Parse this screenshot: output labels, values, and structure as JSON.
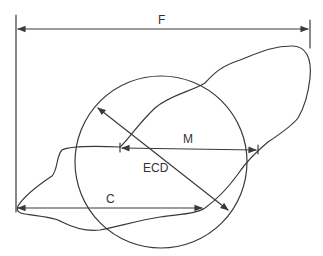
{
  "diagram": {
    "colors": {
      "line": "#3a3a3a",
      "text": "#333333",
      "background": "#ffffff"
    },
    "labels": {
      "feret": "F",
      "martin": "M",
      "ecd": "ECD",
      "chord": "C"
    },
    "shapes": {
      "particle_outline": "irregular-blob",
      "equivalent_circle": {
        "cx": 161,
        "cy": 162,
        "r": 86
      },
      "feret_caliper_left_x": 16,
      "feret_caliper_right_x": 310
    },
    "measurements": [
      {
        "id": "F",
        "name": "Feret diameter",
        "from": [
          16,
          29
        ],
        "to": [
          310,
          29
        ]
      },
      {
        "id": "M",
        "name": "Martin diameter",
        "from": [
          120,
          148
        ],
        "to": [
          258,
          150
        ]
      },
      {
        "id": "ECD",
        "name": "Equivalent circle diameter",
        "from": [
          98,
          108
        ],
        "to": [
          228,
          210
        ]
      },
      {
        "id": "C",
        "name": "Maximum chord",
        "from": [
          17,
          208
        ],
        "to": [
          202,
          208
        ]
      }
    ]
  }
}
